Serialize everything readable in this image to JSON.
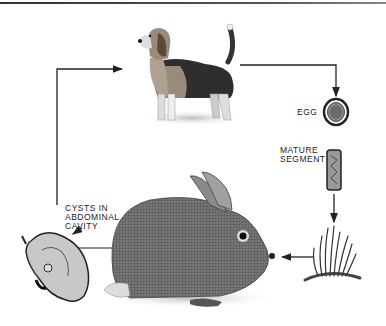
{
  "diagram": {
    "title": "",
    "type": "life-cycle",
    "nodes": [
      {
        "id": "dog",
        "label": "",
        "role": "definitive host"
      },
      {
        "id": "egg",
        "label": "EGG"
      },
      {
        "id": "segment",
        "label": "MATURE SEGMENT",
        "label_lines": [
          "MATURE",
          "SEGMENT"
        ]
      },
      {
        "id": "grass",
        "label": ""
      },
      {
        "id": "rabbit",
        "label": "",
        "role": "intermediate host"
      },
      {
        "id": "cysts",
        "label": "CYSTS IN ABDOMINAL CAVITY",
        "label_lines": [
          "CYSTS IN",
          "ABDOMINAL",
          "CAVITY"
        ]
      }
    ],
    "edges": [
      {
        "from": "dog",
        "to": "egg"
      },
      {
        "from": "egg",
        "to": "segment"
      },
      {
        "from": "segment",
        "to": "grass"
      },
      {
        "from": "grass",
        "to": "rabbit"
      },
      {
        "from": "rabbit",
        "to": "cysts"
      },
      {
        "from": "cysts",
        "to": "dog"
      }
    ]
  },
  "labels": {
    "egg": "EGG",
    "mature": "MATURE",
    "segment": "SEGMENT",
    "cysts1": "CYSTS IN",
    "cysts2": "ABDOMINAL",
    "cysts3": "CAVITY"
  },
  "colors": {
    "line": "#222222",
    "background": "#ffffff"
  }
}
